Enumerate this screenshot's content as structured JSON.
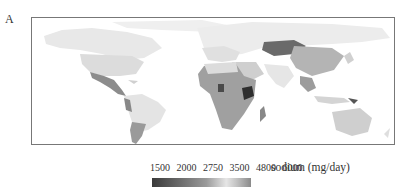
{
  "figure": {
    "panel_label": "A",
    "map_type": "choropleth world map",
    "colorbar": {
      "ticks": [
        "1500",
        "2000",
        "2750",
        "3500",
        "4800",
        "6000"
      ],
      "title": "sodium (mg/day)",
      "colors": [
        "#3a3a3a",
        "#6e6e6e",
        "#9a9a9a",
        "#c4c4c4",
        "#e6e6e6",
        "#8a8a8a"
      ]
    },
    "regions": [
      {
        "name": "North America",
        "shade": "#e8e8e8"
      },
      {
        "name": "USA",
        "shade": "#dcdcdc"
      },
      {
        "name": "Mexico/Central America",
        "shade": "#8c8c8c"
      },
      {
        "name": "South America",
        "shade": "#e4e4e4"
      },
      {
        "name": "Southern South America",
        "shade": "#9a9a9a"
      },
      {
        "name": "Europe/Russia",
        "shade": "#ececec"
      },
      {
        "name": "Africa",
        "shade": "#a0a0a0"
      },
      {
        "name": "Kenya region",
        "shade": "#2e2e2e"
      },
      {
        "name": "Central Asia",
        "shade": "#6a6a6a"
      },
      {
        "name": "China",
        "shade": "#b4b4b4"
      },
      {
        "name": "South Asia",
        "shade": "#e6e6e6"
      },
      {
        "name": "Australia",
        "shade": "#cfcfcf"
      }
    ]
  }
}
